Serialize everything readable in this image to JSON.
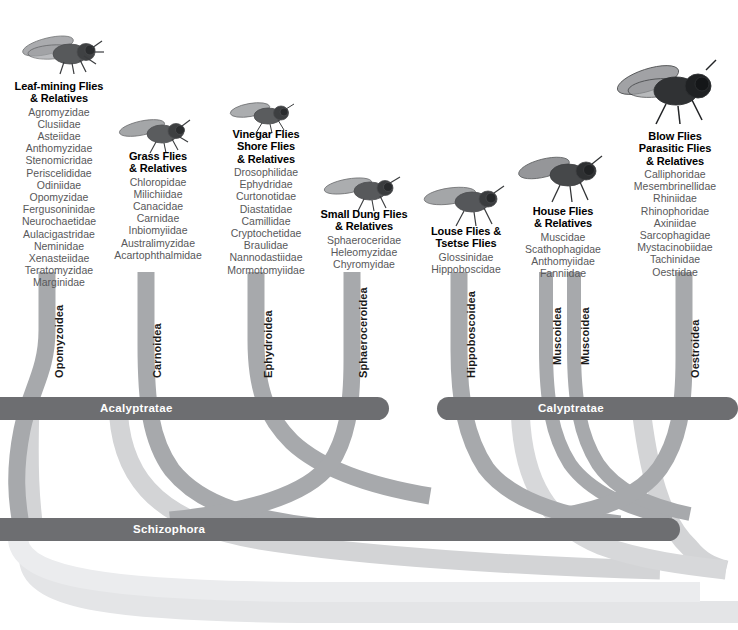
{
  "diagram": {
    "colors": {
      "branch": "#a7a9ac",
      "branch_light": "#c9cbcd",
      "branch_faint": "#dcdddf",
      "bar": "#6d6e71",
      "bar_text": "#ffffff",
      "family_text": "#58585a",
      "title_text": "#000000",
      "background": "#ffffff"
    },
    "bars": [
      {
        "id": "acalyptratae",
        "label": "Acalyptratae",
        "x": 0,
        "y": 397,
        "width": 389,
        "height": 23,
        "label_x": 100,
        "label_y": 403
      },
      {
        "id": "calyptratae",
        "label": "Calyptratae",
        "x": 437,
        "y": 397,
        "width": 301,
        "height": 23,
        "label_x": 538,
        "label_y": 403
      },
      {
        "id": "schizophora",
        "label": "Schizophora",
        "x": 0,
        "y": 518,
        "width": 680,
        "height": 23,
        "label_x": 133,
        "label_y": 524
      }
    ],
    "superfamilies": [
      {
        "id": "opomyzoidea",
        "label": "Opomyzoidea",
        "x": 48,
        "y": 376
      },
      {
        "id": "carnoidea",
        "label": "Carnoidea",
        "x": 146,
        "y": 376
      },
      {
        "id": "ephydroidea",
        "label": "Ephydroidea",
        "x": 256,
        "y": 376
      },
      {
        "id": "sphaeroceroidea",
        "label": "Sphaeroceroidea",
        "x": 351,
        "y": 376
      },
      {
        "id": "hippoboscoidea",
        "label": "Hippoboscoidea",
        "x": 459,
        "y": 376
      },
      {
        "id": "muscoidea-1",
        "label": "Muscoidea",
        "x": 546,
        "y": 376
      },
      {
        "id": "muscoidea-2",
        "label": "Muscoidea",
        "x": 574,
        "y": 376
      },
      {
        "id": "oestroidea",
        "label": "Oestroidea",
        "x": 684,
        "y": 376
      }
    ],
    "clades": [
      {
        "id": "leaf-mining-flies",
        "title_lines": [
          "Leaf-mining Flies",
          "& Relatives"
        ],
        "families": [
          "Agromyzidae",
          "Clusiidae",
          "Asteiidae",
          "Anthomyzidae",
          "Stenomicridae",
          "Periscelididae",
          "Odiniidae",
          "Opomyzidae",
          "Fergusoninidae",
          "Neurochaetidae",
          "Aulacigastridae",
          "Neminidae",
          "Xenasteiidae",
          "Teratomyzidae",
          "Marginidae"
        ],
        "text_left": 0,
        "text_top": 80,
        "text_width": 118,
        "fly_left": 18,
        "fly_top": 24,
        "fly_width": 88,
        "fly_height": 52
      },
      {
        "id": "grass-flies",
        "title_lines": [
          "Grass Flies",
          "& Relatives"
        ],
        "families": [
          "Chloropidae",
          "Milichiidae",
          "Canacidae",
          "Carnidae",
          "Inbiomyiidae",
          "Australimyzidae",
          "Acartophthalmidae"
        ],
        "text_left": 98,
        "text_top": 150,
        "text_width": 120,
        "fly_left": 116,
        "fly_top": 112,
        "fly_width": 76,
        "fly_height": 42
      },
      {
        "id": "vinegar-flies",
        "title_lines": [
          "Vinegar Flies",
          "Shore Flies",
          "& Relatives"
        ],
        "families": [
          "Drosophilidae",
          "Ephydridae",
          "Curtonotidae",
          "Diastatidae",
          "Camillidae",
          "Cryptochetidae",
          "Braulidae",
          "Nannodastiidae",
          "Mormotomyiidae"
        ],
        "text_left": 208,
        "text_top": 128,
        "text_width": 116,
        "fly_left": 228,
        "fly_top": 96,
        "fly_width": 68,
        "fly_height": 38
      },
      {
        "id": "small-dung-flies",
        "title_lines": [
          "Small Dung Flies",
          "& Relatives"
        ],
        "families": [
          "Sphaeroceridae",
          "Heleomyzidae",
          "Chyromyidae"
        ],
        "text_left": 303,
        "text_top": 208,
        "text_width": 122,
        "fly_left": 322,
        "fly_top": 170,
        "fly_width": 80,
        "fly_height": 42
      },
      {
        "id": "louse-flies",
        "title_lines": [
          "Louse Flies &",
          "Tsetse Flies"
        ],
        "families": [
          "Glossinidae",
          "Hippoboscidae"
        ],
        "text_left": 411,
        "text_top": 225,
        "text_width": 110,
        "fly_left": 422,
        "fly_top": 180,
        "fly_width": 84,
        "fly_height": 48
      },
      {
        "id": "house-flies",
        "title_lines": [
          "House Flies",
          "& Relatives"
        ],
        "families": [
          "Muscidae",
          "Scathophagidae",
          "Anthomyiidae",
          "Fanniidae"
        ],
        "text_left": 508,
        "text_top": 205,
        "text_width": 110,
        "fly_left": 516,
        "fly_top": 150,
        "fly_width": 88,
        "fly_height": 54
      },
      {
        "id": "blow-flies",
        "title_lines": [
          "Blow Flies",
          "Parasitic Flies",
          "& Relatives"
        ],
        "families": [
          "Calliphoridae",
          "Mesembrinellidae",
          "Rhiniidae",
          "Rhinophoridae",
          "Axiniidae",
          "Sarcophagidae",
          "Mystacinobiidae",
          "Tachinidae",
          "Oestridae"
        ],
        "text_left": 612,
        "text_top": 130,
        "text_width": 126,
        "fly_left": 612,
        "fly_top": 58,
        "fly_width": 110,
        "fly_height": 68
      }
    ]
  }
}
